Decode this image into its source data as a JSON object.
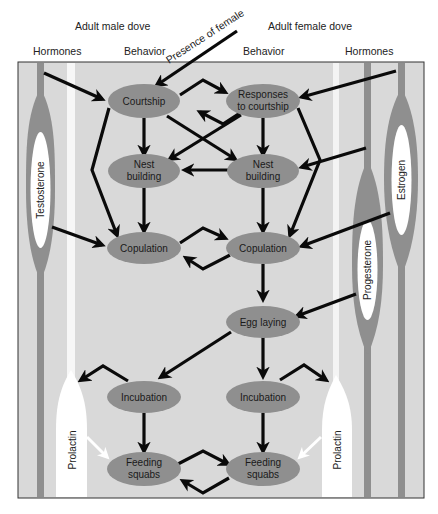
{
  "header": {
    "male_title": "Adult male dove",
    "female_title": "Adult female dove",
    "col_hormones_left": "Hormones",
    "col_behavior_left": "Behavior",
    "col_behavior_right": "Behavior",
    "col_hormones_right": "Hormones",
    "stimulus": "Presence of female"
  },
  "hormones": {
    "male": [
      "Testosterone",
      "Prolactin"
    ],
    "female": [
      "Estrogen",
      "Progesterone",
      "Prolactin"
    ]
  },
  "nodes": {
    "male": {
      "courtship": "Courtship",
      "nest_building_1": "Nest",
      "nest_building_2": "building",
      "copulation": "Copulation",
      "incubation": "Incubation",
      "feeding_1": "Feeding",
      "feeding_2": "squabs"
    },
    "female": {
      "responses_1": "Responses",
      "responses_2": "to courtship",
      "nest_building_1": "Nest",
      "nest_building_2": "building",
      "copulation": "Copulation",
      "egg_laying": "Egg laying",
      "incubation": "Incubation",
      "feeding_1": "Feeding",
      "feeding_2": "squabs"
    }
  },
  "colors": {
    "panel_bg": "#d9d9d9",
    "node_fill": "#8f8f8f",
    "hormone_fill": "#8f8f8f",
    "arrow": "#0a0a0a",
    "white_lane": "#f7f7f7"
  }
}
